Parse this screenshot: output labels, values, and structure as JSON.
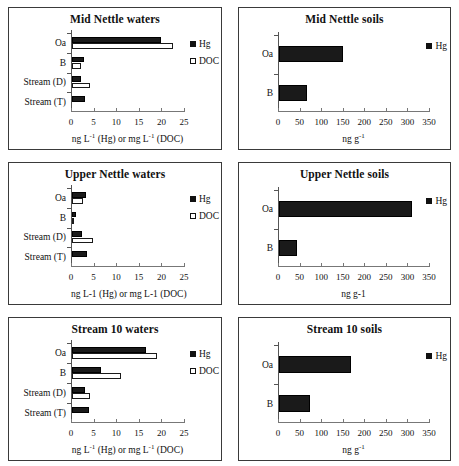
{
  "figure": {
    "panel_count": 6,
    "legend_labels": {
      "hg": "Hg",
      "doc": "DOC"
    },
    "colors": {
      "hg_fill": "#1a1a1a",
      "doc_fill": "#ffffff",
      "stroke": "#111111",
      "frame": "#3a3a3a"
    }
  },
  "chart_data": [
    {
      "type": "bar",
      "orientation": "horizontal",
      "title": "Mid Nettle waters",
      "xlabel": "ng L-1 (Hg) or mg L-1 (DOC)",
      "xlabel_html": "ng L<sup>-1</sup> (Hg) or mg L<sup>-1</sup> (DOC)",
      "ylabel": "",
      "categories": [
        "Oa",
        "B",
        "Stream (D)",
        "Stream (T)"
      ],
      "series": [
        {
          "name": "Hg",
          "values": [
            20.0,
            2.9,
            2.2,
            3.1
          ]
        },
        {
          "name": "DOC",
          "values": [
            22.5,
            2.3,
            4.2,
            null
          ]
        }
      ],
      "xlim": [
        0,
        25
      ],
      "xticks": [
        0,
        5,
        10,
        15,
        20,
        25
      ],
      "grid": false,
      "legend_position": "right"
    },
    {
      "type": "bar",
      "orientation": "horizontal",
      "title": "Mid Nettle soils",
      "xlabel": "ng g-1",
      "xlabel_html": "ng g<sup>-1</sup>",
      "ylabel": "",
      "categories": [
        "Oa",
        "B"
      ],
      "series": [
        {
          "name": "Hg",
          "values": [
            150,
            68
          ]
        }
      ],
      "xlim": [
        0,
        350
      ],
      "xticks": [
        0,
        50,
        100,
        150,
        200,
        250,
        300,
        350
      ],
      "grid": false,
      "legend_position": "right"
    },
    {
      "type": "bar",
      "orientation": "horizontal",
      "title": "Upper Nettle waters",
      "xlabel": "ng L-1 (Hg) or mg L-1 (DOC)",
      "xlabel_html": "ng L-1 (Hg) or mg L-1 (DOC)",
      "ylabel": "",
      "categories": [
        "Oa",
        "B",
        "Stream (D)",
        "Stream (T)"
      ],
      "series": [
        {
          "name": "Hg",
          "values": [
            3.4,
            1.0,
            2.5,
            3.5
          ]
        },
        {
          "name": "DOC",
          "values": [
            2.6,
            0.5,
            4.9,
            null
          ]
        }
      ],
      "xlim": [
        0,
        25
      ],
      "xticks": [
        0,
        5,
        10,
        15,
        20,
        25
      ],
      "grid": false,
      "legend_position": "right"
    },
    {
      "type": "bar",
      "orientation": "horizontal",
      "title": "Upper Nettle soils",
      "xlabel": "ng g-1",
      "xlabel_html": "ng g-1",
      "ylabel": "",
      "categories": [
        "Oa",
        "B"
      ],
      "series": [
        {
          "name": "Hg",
          "values": [
            310,
            45
          ]
        }
      ],
      "xlim": [
        0,
        350
      ],
      "xticks": [
        0,
        50,
        100,
        150,
        200,
        250,
        300,
        350
      ],
      "grid": false,
      "legend_position": "right"
    },
    {
      "type": "bar",
      "orientation": "horizontal",
      "title": "Stream 10 waters",
      "xlabel": "ng L-1 (Hg) or mg L-1 (DOC)",
      "xlabel_html": "ng L<sup>-1</sup> (Hg) or mg L<sup>-1</sup> (DOC)",
      "ylabel": "",
      "categories": [
        "Oa",
        "B",
        "Stream (D)",
        "Stream (T)"
      ],
      "series": [
        {
          "name": "Hg",
          "values": [
            16.5,
            6.7,
            3.0,
            3.9
          ]
        },
        {
          "name": "DOC",
          "values": [
            19.0,
            11.1,
            4.3,
            null
          ]
        }
      ],
      "xlim": [
        0,
        25
      ],
      "xticks": [
        0,
        5,
        10,
        15,
        20,
        25
      ],
      "grid": false,
      "legend_position": "right"
    },
    {
      "type": "bar",
      "orientation": "horizontal",
      "title": "Stream 10 soils",
      "xlabel": "ng g-1",
      "xlabel_html": "ng g<sup>-1</sup>",
      "ylabel": "",
      "categories": [
        "Oa",
        "B"
      ],
      "series": [
        {
          "name": "Hg",
          "values": [
            170,
            74
          ]
        }
      ],
      "xlim": [
        0,
        350
      ],
      "xticks": [
        0,
        50,
        100,
        150,
        200,
        250,
        300,
        350
      ],
      "grid": false,
      "legend_position": "right"
    }
  ]
}
